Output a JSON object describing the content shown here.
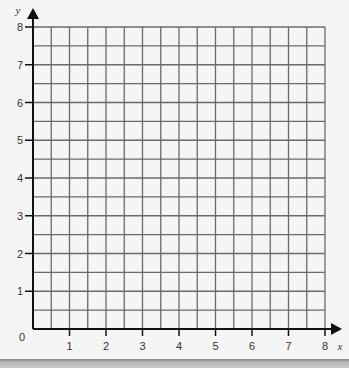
{
  "chart_data": {
    "type": "scatter",
    "title": "",
    "xlabel": "x",
    "ylabel": "y",
    "xlim": [
      0,
      8
    ],
    "ylim": [
      0,
      8
    ],
    "x_ticks": [
      "1",
      "2",
      "3",
      "4",
      "5",
      "6",
      "7",
      "8"
    ],
    "y_ticks": [
      "1",
      "2",
      "3",
      "4",
      "5",
      "6",
      "7",
      "8"
    ],
    "origin_label": "0",
    "grid": true,
    "grid_step": 0.5,
    "series": [],
    "colors": {
      "background": "#f5f5f5",
      "grid": "#6a6a6a",
      "axis": "#111111"
    }
  }
}
